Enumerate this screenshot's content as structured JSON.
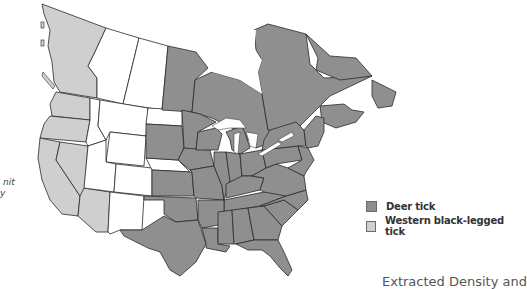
{
  "map": {
    "subject": "Tick distribution in North America",
    "colors": {
      "deer_tick": "#8f8f8f",
      "western_black_legged_tick": "#cfcfcf",
      "none": "#ffffff",
      "border": "#2a2a2a"
    }
  },
  "clipped_text_left": {
    "line1": "nit",
    "line2": "y"
  },
  "legend": {
    "items": [
      {
        "label": "Deer tick",
        "color": "#8f8f8f"
      },
      {
        "label": "Western black-legged tick",
        "color": "#cfcfcf"
      }
    ]
  },
  "footer_clipped": "Extracted Density and"
}
